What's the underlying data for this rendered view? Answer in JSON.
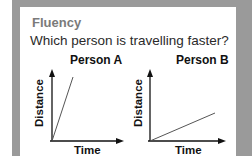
{
  "heading": "Fluency",
  "question": "Which person is travelling faster?",
  "colors": {
    "frame": "#9a9a9a",
    "heading": "#7a7a7a",
    "text": "#2a2a2a",
    "line": "#555555"
  },
  "graphs": [
    {
      "title": "Person A",
      "xlabel": "Time",
      "ylabel": "Distance",
      "slope_description": "steep"
    },
    {
      "title": "Person B",
      "xlabel": "Time",
      "ylabel": "Distance",
      "slope_description": "shallow"
    }
  ]
}
